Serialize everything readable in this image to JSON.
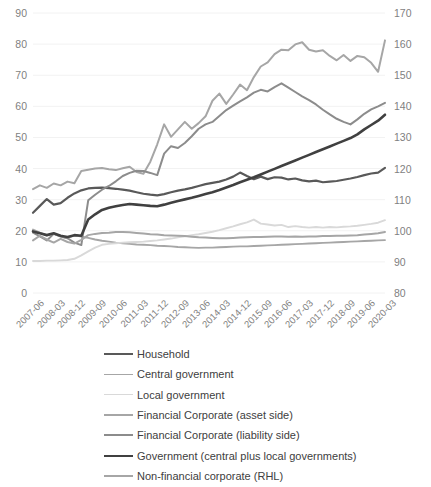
{
  "chart_data": {
    "type": "line",
    "title": "",
    "xlabel": "",
    "ylabel": "",
    "y2label": "",
    "grid": true,
    "legend_position": "bottom",
    "ylim": [
      0,
      90
    ],
    "ytick_step": 10,
    "y2lim": [
      80,
      170
    ],
    "y2tick_step": 10,
    "yticks": [
      "0",
      "10",
      "20",
      "30",
      "40",
      "50",
      "60",
      "70",
      "80",
      "90"
    ],
    "y2ticks": [
      "80",
      "90",
      "100",
      "110",
      "120",
      "130",
      "140",
      "150",
      "160",
      "170"
    ],
    "x": [
      "2007-06",
      "2007-09",
      "2007-12",
      "2008-03",
      "2008-06",
      "2008-09",
      "2008-12",
      "2009-03",
      "2009-06",
      "2009-09",
      "2009-12",
      "2010-03",
      "2010-06",
      "2010-09",
      "2010-12",
      "2011-03",
      "2011-06",
      "2011-09",
      "2011-12",
      "2012-03",
      "2012-06",
      "2012-09",
      "2012-12",
      "2013-03",
      "2013-06",
      "2013-09",
      "2013-12",
      "2014-03",
      "2014-06",
      "2014-09",
      "2014-12",
      "2015-03",
      "2015-06",
      "2015-09",
      "2015-12",
      "2016-03",
      "2016-06",
      "2016-09",
      "2016-12",
      "2017-03",
      "2017-06",
      "2017-09",
      "2017-12",
      "2018-03",
      "2018-06",
      "2018-09",
      "2018-12",
      "2019-03",
      "2019-06",
      "2019-09",
      "2019-12",
      "2020-03"
    ],
    "xtick_labels": [
      "2007-06",
      "2008-03",
      "2008-12",
      "2009-09",
      "2010-06",
      "2011-03",
      "2011-12",
      "2012-09",
      "2013-06",
      "2014-03",
      "2014-12",
      "2015-09",
      "2016-06",
      "2017-03",
      "2017-12",
      "2018-09",
      "2019-06",
      "2020-03"
    ],
    "xtick_every": 3,
    "series": [
      {
        "name": "Household",
        "color": "#595959",
        "width": 2.2,
        "axis": "left",
        "values": [
          25.8,
          28.0,
          30.2,
          28.4,
          28.9,
          30.6,
          32.0,
          33.0,
          33.6,
          33.8,
          33.9,
          33.7,
          33.5,
          33.2,
          32.9,
          32.4,
          31.9,
          31.6,
          31.4,
          31.8,
          32.4,
          32.9,
          33.3,
          33.8,
          34.4,
          35.0,
          35.4,
          35.8,
          36.5,
          37.4,
          38.7,
          37.6,
          36.6,
          37.4,
          36.6,
          37.2,
          37.1,
          36.5,
          36.8,
          36.2,
          35.9,
          36.1,
          35.6,
          35.8,
          36.0,
          36.4,
          36.8,
          37.3,
          37.9,
          38.4,
          38.7,
          40.2
        ]
      },
      {
        "name": "Central government",
        "color": "#a6a6a6",
        "width": 1.9,
        "axis": "left",
        "values": [
          20.4,
          19.4,
          18.5,
          19.0,
          18.1,
          17.6,
          18.6,
          18.1,
          17.7,
          17.2,
          16.8,
          16.5,
          16.2,
          16.0,
          15.8,
          15.6,
          15.5,
          15.4,
          15.2,
          15.1,
          15.0,
          14.8,
          14.7,
          14.6,
          14.5,
          14.6,
          14.6,
          14.7,
          14.8,
          14.9,
          15.0,
          15.0,
          15.1,
          15.2,
          15.3,
          15.4,
          15.5,
          15.6,
          15.7,
          15.8,
          15.9,
          16.0,
          16.1,
          16.2,
          16.3,
          16.4,
          16.5,
          16.6,
          16.7,
          16.8,
          16.9,
          17.0
        ]
      },
      {
        "name": "Local government",
        "color": "#d9d9d9",
        "width": 1.9,
        "axis": "left",
        "values": [
          10.3,
          10.3,
          10.4,
          10.4,
          10.5,
          10.6,
          11.0,
          12.1,
          13.4,
          14.6,
          15.5,
          15.8,
          16.0,
          16.2,
          16.3,
          16.4,
          16.5,
          16.7,
          16.9,
          17.2,
          17.5,
          17.9,
          18.2,
          18.6,
          18.9,
          19.3,
          19.7,
          20.2,
          20.8,
          21.4,
          22.1,
          22.7,
          23.6,
          22.3,
          22.0,
          21.7,
          21.9,
          21.2,
          21.5,
          21.2,
          21.0,
          21.2,
          21.0,
          21.2,
          21.1,
          21.3,
          21.4,
          21.6,
          21.9,
          22.2,
          22.6,
          23.4
        ]
      },
      {
        "name": "Financial Corporate (asset side)",
        "color": "#a6a6a6",
        "width": 2.0,
        "axis": "left",
        "values": [
          33.4,
          34.6,
          33.8,
          35.2,
          34.6,
          35.8,
          35.3,
          39.2,
          39.6,
          40.0,
          40.2,
          39.8,
          39.5,
          40.1,
          40.6,
          38.9,
          38.3,
          42.2,
          47.8,
          54.2,
          50.2,
          52.6,
          55.0,
          52.8,
          54.6,
          56.8,
          61.8,
          64.1,
          60.8,
          63.8,
          67.0,
          65.2,
          69.4,
          72.8,
          74.1,
          76.8,
          78.2,
          78.0,
          79.9,
          80.6,
          78.2,
          77.6,
          78.0,
          76.2,
          74.8,
          76.5,
          74.6,
          76.2,
          75.8,
          74.0,
          71.1,
          81.2
        ]
      },
      {
        "name": "Financial Corporate (liability side)",
        "color": "#8c8c8c",
        "width": 2.0,
        "axis": "left",
        "values": [
          19.4,
          18.2,
          16.9,
          19.0,
          18.2,
          17.6,
          16.2,
          15.4,
          29.8,
          31.6,
          33.2,
          34.4,
          35.9,
          37.6,
          38.6,
          39.3,
          39.2,
          38.6,
          37.9,
          44.8,
          47.2,
          46.6,
          48.2,
          50.4,
          52.8,
          54.2,
          55.0,
          56.9,
          58.8,
          60.2,
          61.6,
          62.9,
          64.4,
          65.3,
          64.8,
          66.2,
          67.4,
          66.0,
          64.6,
          63.2,
          62.0,
          60.6,
          58.9,
          57.4,
          56.0,
          55.0,
          54.2,
          55.8,
          57.6,
          59.0,
          60.0,
          61.1
        ]
      },
      {
        "name": "Government (central plus local governments)",
        "color": "#404040",
        "width": 2.6,
        "axis": "left",
        "values": [
          19.8,
          19.2,
          18.6,
          19.2,
          18.4,
          18.0,
          18.6,
          18.4,
          23.6,
          25.3,
          26.7,
          27.4,
          27.9,
          28.3,
          28.6,
          28.4,
          28.2,
          28.0,
          27.9,
          28.4,
          29.0,
          29.6,
          30.1,
          30.6,
          31.2,
          31.8,
          32.4,
          33.1,
          33.9,
          34.7,
          35.6,
          36.4,
          37.2,
          38.1,
          39.0,
          39.9,
          40.8,
          41.7,
          42.6,
          43.5,
          44.4,
          45.3,
          46.2,
          47.1,
          48.0,
          48.9,
          49.8,
          51.0,
          52.6,
          54.0,
          55.4,
          57.3
        ]
      },
      {
        "name": "Non-financial corporate (RHL)",
        "color": "#a6a6a6",
        "width": 2.0,
        "axis": "right",
        "values": [
          96.9,
          98.4,
          97.2,
          96.2,
          97.4,
          96.4,
          95.9,
          97.1,
          98.6,
          99.0,
          99.3,
          99.4,
          99.6,
          99.6,
          99.5,
          99.3,
          99.1,
          98.9,
          98.8,
          98.6,
          98.5,
          98.4,
          98.3,
          98.1,
          97.9,
          97.8,
          97.7,
          97.6,
          97.6,
          97.7,
          97.8,
          97.9,
          98.0,
          98.0,
          98.1,
          98.2,
          98.2,
          98.1,
          98.2,
          98.1,
          98.2,
          98.2,
          98.3,
          98.3,
          98.4,
          98.4,
          98.5,
          98.6,
          98.8,
          99.0,
          99.2,
          99.6
        ]
      }
    ],
    "legend": [
      {
        "label": "Household",
        "color": "#595959",
        "width": 2.2
      },
      {
        "label": "Central government",
        "color": "#a6a6a6",
        "width": 1.9
      },
      {
        "label": "Local government",
        "color": "#d9d9d9",
        "width": 1.9
      },
      {
        "label": "Financial Corporate (asset side)",
        "color": "#a6a6a6",
        "width": 2.0
      },
      {
        "label": "Financial Corporate (liability side)",
        "color": "#8c8c8c",
        "width": 2.0
      },
      {
        "label": "Government (central plus local governments)",
        "color": "#404040",
        "width": 2.6
      },
      {
        "label": "Non-financial corporate (RHL)",
        "color": "#a6a6a6",
        "width": 2.0
      }
    ],
    "colors": {
      "gridline": "#f2f2f2",
      "tick_text": "#7f7f7f",
      "legend_text": "#404040",
      "background": "#ffffff"
    }
  }
}
